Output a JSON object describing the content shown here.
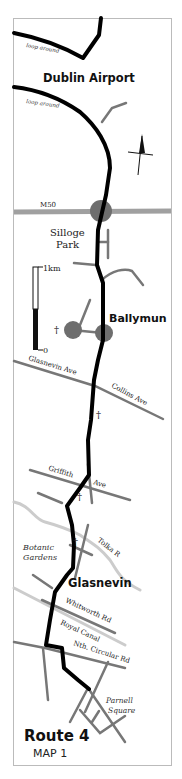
{
  "map": {
    "title": "Route 4",
    "subtitle": "MAP 1",
    "colors": {
      "route": "#000000",
      "minor_road": "#777777",
      "motorway": "#a0a0a0",
      "roundabout": "#6e6e6e",
      "river_canal": "#cccccc",
      "frame": "#bbbbbb"
    },
    "places": {
      "dublin_airport": "Dublin Airport",
      "silloge_line1": "Silloge",
      "silloge_line2": "Park",
      "ballymun": "Ballymun",
      "glasnevin": "Glasnevin",
      "botanic_line1": "Botanic",
      "botanic_line2": "Gardens",
      "parnell_line1": "Parnell",
      "parnell_line2": "Square"
    },
    "roads": {
      "loop_around_1": "loop around",
      "loop_around_2": "loop around",
      "m50": "M50",
      "glasnevin_ave": "Glasnevin Ave",
      "collins_ave": "Collins Ave",
      "griffith": "Griffith",
      "ave": "Ave",
      "tolka": "Tolka R",
      "whitworth": "Whitworth Rd",
      "royal_canal": "Royal Canal",
      "nth_circular": "Nth. Circular Rd"
    },
    "scale": {
      "top_label": "1km",
      "bottom_label": "0"
    },
    "icons": {
      "north_arrow": "north-arrow-icon",
      "church": "†"
    },
    "churches": [
      "†",
      "†",
      "†",
      "†"
    ]
  }
}
